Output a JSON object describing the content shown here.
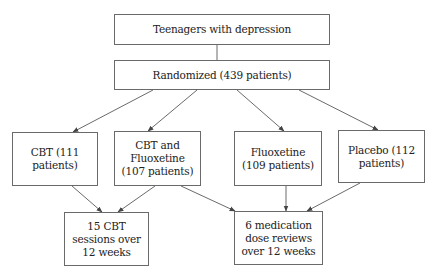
{
  "diagram": {
    "type": "flowchart",
    "nodes": {
      "population": {
        "label": "Teenagers with depression"
      },
      "randomized": {
        "label": "Randomized (439 patients)"
      },
      "cbt": {
        "label": "CBT (111\npatients)"
      },
      "cbt_fluoxetine": {
        "label": "CBT and\nFluoxetine\n(107 patients)"
      },
      "fluoxetine": {
        "label": "Fluoxetine\n(109 patients)"
      },
      "placebo": {
        "label": "Placebo (112\npatients)"
      },
      "cbt_sessions": {
        "label": "15 CBT\nsessions over\n12 weeks"
      },
      "medication_reviews": {
        "label": "6 medication\ndose reviews\nover 12 weeks"
      }
    },
    "edges": [
      {
        "from": "population",
        "to": "randomized",
        "arrow": false
      },
      {
        "from": "randomized",
        "to": "cbt",
        "arrow": true
      },
      {
        "from": "randomized",
        "to": "cbt_fluoxetine",
        "arrow": true
      },
      {
        "from": "randomized",
        "to": "fluoxetine",
        "arrow": true
      },
      {
        "from": "randomized",
        "to": "placebo",
        "arrow": true
      },
      {
        "from": "cbt",
        "to": "cbt_sessions",
        "arrow": true
      },
      {
        "from": "cbt_fluoxetine",
        "to": "cbt_sessions",
        "arrow": true
      },
      {
        "from": "cbt_fluoxetine",
        "to": "medication_reviews",
        "arrow": true
      },
      {
        "from": "fluoxetine",
        "to": "medication_reviews",
        "arrow": true
      },
      {
        "from": "placebo",
        "to": "medication_reviews",
        "arrow": true
      }
    ],
    "colors": {
      "line": "#6a6a6a",
      "text": "#222222",
      "background": "#ffffff"
    }
  }
}
